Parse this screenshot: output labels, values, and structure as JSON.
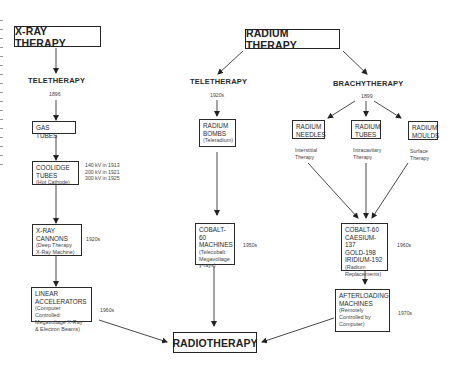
{
  "diagram": {
    "roots": {
      "xray": "X-RAY THERAPY",
      "radium": "RADIUM THERAPY",
      "final": "RADIOTHERAPY"
    },
    "xray_branch": {
      "heading": "TELETHERAPY",
      "year": "1896",
      "nodes": [
        {
          "title": "GAS TUBES"
        },
        {
          "title": "COOLIDGE TUBES",
          "title_lines": [
            "COOLIDGE",
            "TUBES"
          ],
          "sub": "(Hot Cathode)",
          "notes": [
            "140 kV in 1913",
            "200 kV in 1921",
            "300 kV in 1925"
          ]
        },
        {
          "title_lines": [
            "X-RAY",
            "CANNONS"
          ],
          "sub_lines": [
            "(Deep Therapy",
            "X-Ray Machine)"
          ],
          "date": "1920s"
        },
        {
          "title_lines": [
            "LINEAR",
            "ACCELERATORS"
          ],
          "sub_lines": [
            "(Computer Controlled:",
            "Megavoltage X-Ray",
            "& Electron Beams)"
          ],
          "date": "1960s"
        }
      ]
    },
    "radium_tele_branch": {
      "heading": "TELETHERAPY",
      "year": "1920s",
      "nodes": [
        {
          "title_lines": [
            "RADIUM",
            "BOMBS"
          ],
          "sub": "(Teleradium)"
        },
        {
          "title_lines": [
            "COBALT-60",
            "MACHINES"
          ],
          "sub_lines": [
            "(Telecobalt:",
            "Megavoltage",
            "γ-rays)"
          ],
          "date": "1950s"
        }
      ]
    },
    "brachy_branch": {
      "heading": "BRACHYTHERAPY",
      "year": "1899",
      "sources": [
        {
          "title_lines": [
            "RADIUM",
            "NEEDLES"
          ],
          "note_lines": [
            "Interstitial",
            "Therapy"
          ]
        },
        {
          "title_lines": [
            "RADIUM",
            "TUBES"
          ],
          "note_lines": [
            "Intracavitary",
            "Therapy"
          ]
        },
        {
          "title_lines": [
            "RADIUM",
            "MOULDS"
          ],
          "note_lines": [
            "Surface",
            "Therapy"
          ]
        }
      ],
      "nodes": [
        {
          "title_lines": [
            "COBALT-60",
            "CAESIUM-137",
            "GOLD-198",
            "IRIDIUM-192"
          ],
          "sub_lines": [
            "(Radium",
            "Replacements)"
          ],
          "date": "1960s"
        },
        {
          "title_lines": [
            "AFTERLOADING",
            "MACHINES"
          ],
          "sub_lines": [
            "(Remotely",
            "Controlled by",
            "Computer)"
          ],
          "date": "1970s"
        }
      ]
    }
  }
}
